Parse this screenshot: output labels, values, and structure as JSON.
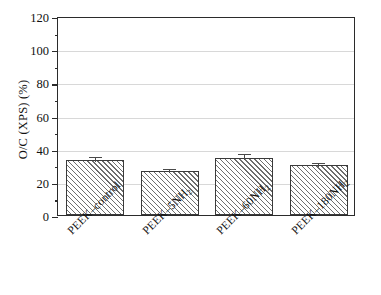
{
  "chart_data": {
    "type": "bar",
    "title": "",
    "xlabel": "",
    "ylabel": "O/C (XPS) (%)",
    "categories": [
      "PEEK–control",
      "PEEK–5NH2",
      "PEEK–60NH2",
      "PEEK–180NH2"
    ],
    "category_labels_html": [
      "PEEK–control",
      "PEEK–5NH<sub>2</sub>",
      "PEEK–60NH<sub>2</sub>",
      "PEEK–180NH<sub>2</sub>"
    ],
    "values": [
      33,
      26.5,
      34.5,
      30
    ],
    "errors": [
      3,
      2.5,
      3.5,
      2.5
    ],
    "ylim": [
      0,
      120
    ],
    "ytick_labels": [
      "0",
      "20",
      "40",
      "60",
      "80",
      "100",
      "120"
    ],
    "ytick_values": [
      0,
      20,
      40,
      60,
      80,
      100,
      120
    ],
    "yminor_values": [
      10,
      30,
      50,
      70,
      90,
      110
    ],
    "grid": "horizontal",
    "legend": "none",
    "bar_fill": "diagonal-hatch",
    "bar_edge_color": "#3a3a3a",
    "grid_color": "#d8d8d8",
    "axis_color": "#2b2b2b"
  }
}
